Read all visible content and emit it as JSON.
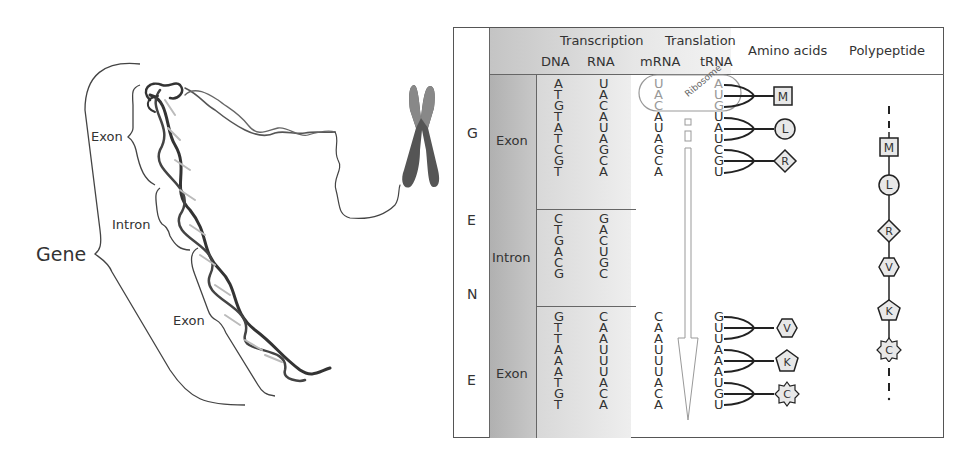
{
  "left_illustration": {
    "gene_label": "Gene",
    "segment_labels": [
      "Exon",
      "Intron",
      "Exon"
    ],
    "elements": [
      "dna-double-helix",
      "chromosome-icon"
    ]
  },
  "table": {
    "header": {
      "group_transcription": "Transcription",
      "group_translation": "Translation",
      "col_dna": "DNA",
      "col_rna": "RNA",
      "col_mrna": "mRNA",
      "col_trna": "tRNA",
      "col_amino": "Amino acids",
      "col_polypeptide": "Polypeptide"
    },
    "gene_letters": [
      "G",
      "E",
      "N",
      "E"
    ],
    "ribosome_label": "Ribosome",
    "rows": [
      {
        "region": "Exon",
        "dna": [
          "A",
          "T",
          "G",
          "T",
          "A",
          "T",
          "C",
          "G",
          "T"
        ],
        "rna": [
          "U",
          "A",
          "C",
          "A",
          "U",
          "A",
          "G",
          "C",
          "A"
        ],
        "mrna": [
          "U",
          "A",
          "C",
          "A",
          "U",
          "A",
          "G",
          "C",
          "A"
        ],
        "trna": [
          "A",
          "U",
          "G",
          "U",
          "A",
          "U",
          "C",
          "G",
          "U"
        ],
        "amino_acids": [
          {
            "letter": "M",
            "shape": "square"
          },
          {
            "letter": "L",
            "shape": "circle"
          },
          {
            "letter": "R",
            "shape": "diamond"
          }
        ]
      },
      {
        "region": "Intron",
        "dna": [
          "C",
          "T",
          "G",
          "A",
          "C",
          "G"
        ],
        "rna": [
          "G",
          "A",
          "C",
          "U",
          "G",
          "C"
        ]
      },
      {
        "region": "Exon",
        "dna": [
          "G",
          "T",
          "T",
          "A",
          "A",
          "A",
          "T",
          "G",
          "T"
        ],
        "rna": [
          "C",
          "A",
          "A",
          "U",
          "U",
          "U",
          "A",
          "C",
          "A"
        ],
        "mrna": [
          "C",
          "A",
          "A",
          "U",
          "U",
          "U",
          "A",
          "C",
          "A"
        ],
        "trna": [
          "G",
          "U",
          "U",
          "A",
          "A",
          "A",
          "U",
          "G",
          "U"
        ],
        "amino_acids": [
          {
            "letter": "V",
            "shape": "hexagon"
          },
          {
            "letter": "K",
            "shape": "pentagon"
          },
          {
            "letter": "C",
            "shape": "star"
          }
        ]
      }
    ],
    "polypeptide": [
      "M",
      "L",
      "R",
      "V",
      "K",
      "C"
    ]
  },
  "colors": {
    "header_shade": "#cfcfcf",
    "region_shade": "#b8b8b8",
    "seq_shade": "#e2e2e2",
    "line": "#444444",
    "shape_fill": "#e8e8e8",
    "faint": "#999999"
  }
}
